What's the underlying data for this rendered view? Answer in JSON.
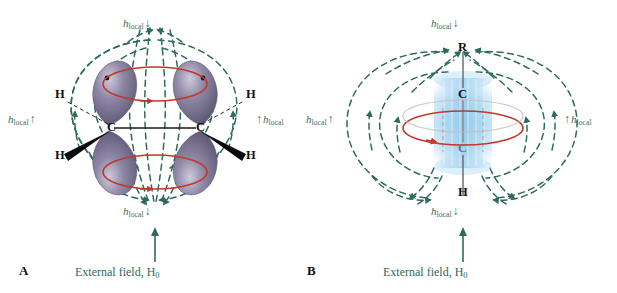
{
  "figure": {
    "background": "#ffffff",
    "colors": {
      "field_line": "#2e6b5e",
      "label_green": "#356b5f",
      "circulation_red": "#c0392b",
      "orbital_purple": "#7b7591",
      "orbital_purple_light": "#b9b4c8",
      "pi_cloud_blue": "#9fcfee",
      "bond_gray": "#6f6f78",
      "atom_black": "#101010"
    }
  },
  "panels": [
    {
      "id": "A",
      "letter": "A",
      "molecule_name": "alkene",
      "caption": {
        "text": "External field, H",
        "field_symbol": "H",
        "field_subscript": "0",
        "full": "External field, H0"
      },
      "atoms": [
        {
          "label": "C",
          "position": "left-center"
        },
        {
          "label": "C",
          "position": "right-center"
        },
        {
          "label": "H",
          "position": "upper-left"
        },
        {
          "label": "H",
          "position": "lower-left"
        },
        {
          "label": "H",
          "position": "upper-right"
        },
        {
          "label": "H",
          "position": "lower-right"
        }
      ],
      "local_field_labels": [
        {
          "position": "top",
          "symbol": "h",
          "subscript": "local",
          "arrow": "↓",
          "arrow_dir": "down"
        },
        {
          "position": "left",
          "symbol": "h",
          "subscript": "local",
          "arrow": "↑",
          "arrow_dir": "up"
        },
        {
          "position": "right",
          "symbol": "h",
          "subscript": "local",
          "arrow": "↑",
          "arrow_dir": "up"
        },
        {
          "position": "bottom",
          "symbol": "h",
          "subscript": "local",
          "arrow": "↓",
          "arrow_dir": "down"
        }
      ],
      "features": [
        "four p-orbital lobes shaded purple",
        "two red electron-circulation ellipses above and below the C=C axis",
        "teal dashed induced magnetic field lines",
        "bold wedge bonds to lower H atoms",
        "hashed bonds to upper H atoms"
      ]
    },
    {
      "id": "B",
      "letter": "B",
      "molecule_name": "alkyne",
      "caption": {
        "text": "External field, H",
        "field_symbol": "H",
        "field_subscript": "0",
        "full": "External field, H0"
      },
      "atoms": [
        {
          "label": "R",
          "position": "top"
        },
        {
          "label": "C",
          "position": "upper-center"
        },
        {
          "label": "C",
          "position": "lower-center"
        },
        {
          "label": "H",
          "position": "bottom"
        }
      ],
      "local_field_labels": [
        {
          "position": "top",
          "symbol": "h",
          "subscript": "local",
          "arrow": "↓",
          "arrow_dir": "down"
        },
        {
          "position": "left",
          "symbol": "h",
          "subscript": "local",
          "arrow": "↑",
          "arrow_dir": "up"
        },
        {
          "position": "right",
          "symbol": "h",
          "subscript": "local",
          "arrow": "↑",
          "arrow_dir": "up"
        },
        {
          "position": "bottom",
          "symbol": "h",
          "subscript": "local",
          "arrow": "↓",
          "arrow_dir": "down"
        }
      ],
      "features": [
        "cylindrical blue pi-electron cloud around the C-C triple bond axis",
        "red electron-circulation ellipse perpendicular to the bond axis",
        "teal dashed induced magnetic field lines forming two lobes",
        "vertical molecular axis R-C-C-H"
      ]
    }
  ]
}
